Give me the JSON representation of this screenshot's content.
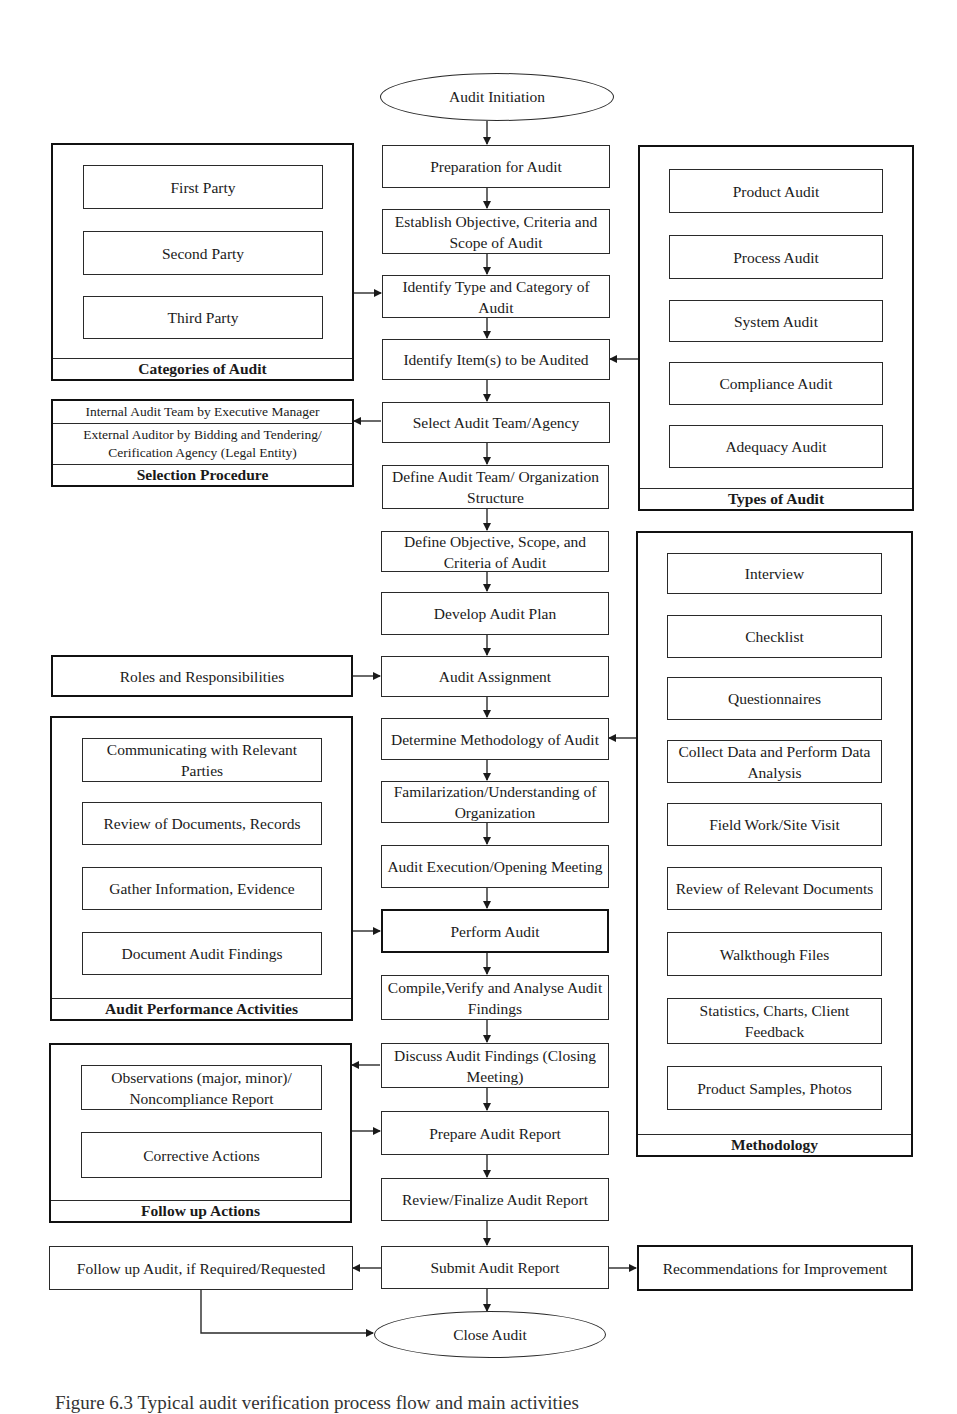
{
  "main_flow": {
    "start": "Audit Initiation",
    "steps": [
      "Preparation for Audit",
      "Establish Objective, Criteria and Scope of Audit",
      "Identify Type and Category of Audit",
      "Identify Item(s) to be Audited",
      "Select Audit Team/Agency",
      "Define Audit Team/ Organization Structure",
      "Define Objective, Scope, and Criteria of Audit",
      "Develop Audit Plan",
      "Audit Assignment",
      "Determine Methodology of Audit",
      "Familarization/Understanding of Organization",
      "Audit Execution/Opening Meeting",
      "Perform Audit",
      "Compile,Verify and Analyse Audit Findings",
      "Discuss Audit Findings (Closing Meeting)",
      "Prepare Audit Report",
      "Review/Finalize Audit Report",
      "Submit Audit Report"
    ],
    "end": "Close Audit"
  },
  "categories_of_audit": {
    "title": "Categories of Audit",
    "items": [
      "First Party",
      "Second Party",
      "Third Party"
    ]
  },
  "types_of_audit": {
    "title": "Types of Audit",
    "items": [
      "Product Audit",
      "Process Audit",
      "System Audit",
      "Compliance  Audit",
      "Adequacy Audit"
    ]
  },
  "selection_procedure": {
    "title": "Selection Procedure",
    "items": [
      "Internal Audit Team by Executive Manager",
      "External Auditor by Bidding and Tendering/ Cerification Agency (Legal Entity)"
    ]
  },
  "roles": {
    "label": "Roles and Responsibilities"
  },
  "audit_performance_activities": {
    "title": "Audit Performance Activities",
    "items": [
      "Communicating with Relevant Parties",
      "Review of Documents, Records",
      "Gather Information, Evidence",
      "Document Audit Findings"
    ]
  },
  "methodology": {
    "title": "Methodology",
    "items": [
      "Interview",
      "Checklist",
      "Questionnaires",
      "Collect Data and Perform Data Analysis",
      "Field Work/Site Visit",
      "Review of Relevant Documents",
      "Walkthough Files",
      "Statistics, Charts, Client Feedback",
      "Product Samples, Photos"
    ]
  },
  "follow_up_actions": {
    "title": "Follow up Actions",
    "items": [
      "Observations (major, minor)/ Noncompliance Report",
      "Corrective Actions"
    ]
  },
  "follow_up_audit": {
    "label": "Follow up Audit, if Required/Requested"
  },
  "recommendations": {
    "label": "Recommendations for Improvement"
  },
  "caption": "Figure 6.3 Typical audit verification process flow and main activities"
}
